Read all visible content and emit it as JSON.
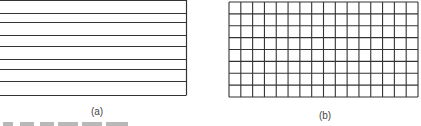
{
  "figure": {
    "panel_a": {
      "label": "(a)",
      "type": "horizontal-lines",
      "line_ys": [
        0,
        13,
        22,
        35,
        46,
        59,
        69,
        81,
        95
      ],
      "x_range": [
        0,
        186
      ],
      "stroke": "#333333"
    },
    "panel_b": {
      "label": "(b)",
      "type": "grid",
      "columns": 16,
      "rows": 8,
      "x_range": [
        229,
        418
      ],
      "y_range": [
        2,
        97
      ],
      "stroke": "#333333"
    }
  }
}
